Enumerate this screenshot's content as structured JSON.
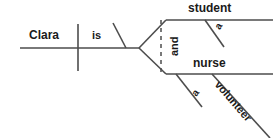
{
  "diagram": {
    "type": "reed-kellogg-sentence-diagram",
    "sentence": "Clara is a student and a nurse volunteer",
    "line_color": "#4d4d4d",
    "text_color": "#1a1a1a",
    "background": "#ffffff",
    "labels": {
      "subject": "Clara",
      "verb": "is",
      "conjunction": "and",
      "predicate_nominative_top": "student",
      "predicate_nominative_bottom": "nurse",
      "article_top": "a",
      "article_bottom": "a",
      "modifier_bottom": "volunteer"
    }
  }
}
